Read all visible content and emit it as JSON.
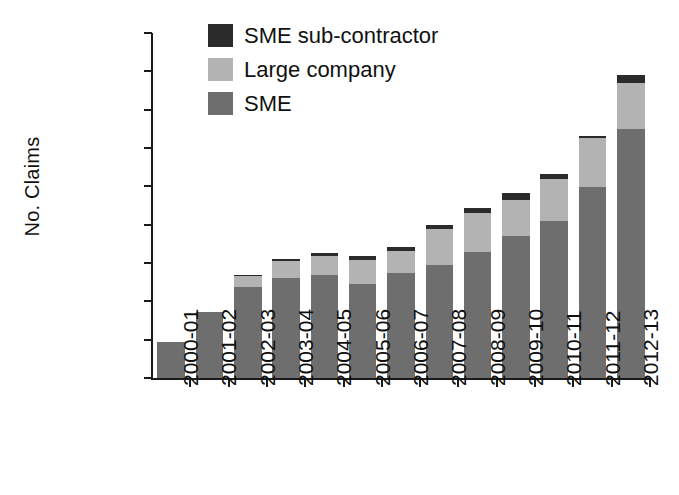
{
  "chart_data": {
    "type": "bar",
    "subtype": "stacked-vertical",
    "title": "",
    "xlabel": "",
    "ylabel": "No. Claims",
    "ylim": [
      0,
      18000
    ],
    "ytick_values": [
      0,
      2000,
      4000,
      6000,
      8000,
      10000,
      12000,
      14000,
      16000,
      18000
    ],
    "ytick_labels": [
      "0",
      "2,000",
      "4,000",
      "6,000",
      "8,000",
      "10,000",
      "12,000",
      "14,000",
      "16,000",
      "18,000"
    ],
    "grid": false,
    "legend_position": "top-center",
    "categories": [
      "2000-01",
      "2001-02",
      "2002-03",
      "2003-04",
      "2004-05",
      "2005-06",
      "2006-07",
      "2007-08",
      "2008-09",
      "2009-10",
      "2010-11",
      "2011-12",
      "2012-13"
    ],
    "series": [
      {
        "name": "SME",
        "color": "#6e6e6e",
        "values": [
          1880,
          3440,
          4750,
          5200,
          5350,
          4900,
          5500,
          5900,
          6550,
          7400,
          8200,
          9950,
          13000
        ]
      },
      {
        "name": "Large company",
        "color": "#b3b3b3",
        "values": [
          0,
          0,
          550,
          900,
          1000,
          1250,
          1150,
          1900,
          2050,
          1900,
          2200,
          2550,
          2400
        ]
      },
      {
        "name": "SME sub-contractor",
        "color": "#2b2b2b",
        "values": [
          0,
          0,
          100,
          120,
          150,
          200,
          200,
          200,
          250,
          350,
          250,
          150,
          400
        ]
      }
    ],
    "totals": [
      1880,
      3440,
      5400,
      6220,
      6500,
      6350,
      6850,
      8000,
      8850,
      9650,
      10650,
      12650,
      15800
    ]
  },
  "legend": {
    "items": [
      {
        "label": "SME sub-contractor",
        "color": "#2b2b2b"
      },
      {
        "label": "Large company",
        "color": "#b3b3b3"
      },
      {
        "label": "SME",
        "color": "#6e6e6e"
      }
    ]
  },
  "axes": {
    "y_title": "No. Claims"
  }
}
